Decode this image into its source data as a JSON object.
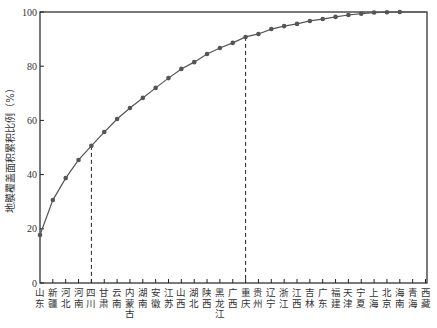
{
  "chart_data": {
    "type": "line",
    "title": "",
    "xlabel": "",
    "ylabel": "地膜覆盖面积累积比例（%）",
    "ylim": [
      0,
      100
    ],
    "yticks": [
      0,
      20,
      40,
      60,
      80,
      100
    ],
    "grid": false,
    "legend": null,
    "categories": [
      "山东",
      "新疆",
      "河北",
      "河南",
      "四川",
      "甘肃",
      "云南",
      "内蒙古",
      "湖南",
      "安徽",
      "江苏",
      "山西",
      "湖北",
      "陕西",
      "黑龙江",
      "广西",
      "重庆",
      "贵州",
      "辽宁",
      "浙江",
      "江西",
      "吉林",
      "广东",
      "福建",
      "天津",
      "宁夏",
      "上海",
      "北京",
      "海南",
      "青海",
      "西藏"
    ],
    "series": [
      {
        "name": "累积比例",
        "values": [
          17.7,
          30.6,
          38.7,
          45.4,
          50.6,
          55.7,
          60.5,
          64.6,
          68.3,
          72.0,
          75.6,
          79.0,
          81.5,
          84.5,
          86.7,
          88.6,
          90.8,
          91.9,
          93.7,
          94.8,
          95.6,
          96.7,
          97.4,
          98.2,
          98.9,
          99.4,
          99.8,
          99.9,
          100.0,
          100.0,
          100.0
        ]
      }
    ],
    "annotations": [
      {
        "type": "dashed-vline",
        "category": "四川",
        "y": 50.6
      },
      {
        "type": "dashed-vline",
        "category": "重庆",
        "y": 90.8
      }
    ]
  },
  "colors": {
    "line": "#555555",
    "marker": "#555555",
    "axis": "#222222",
    "text": "#333333"
  }
}
